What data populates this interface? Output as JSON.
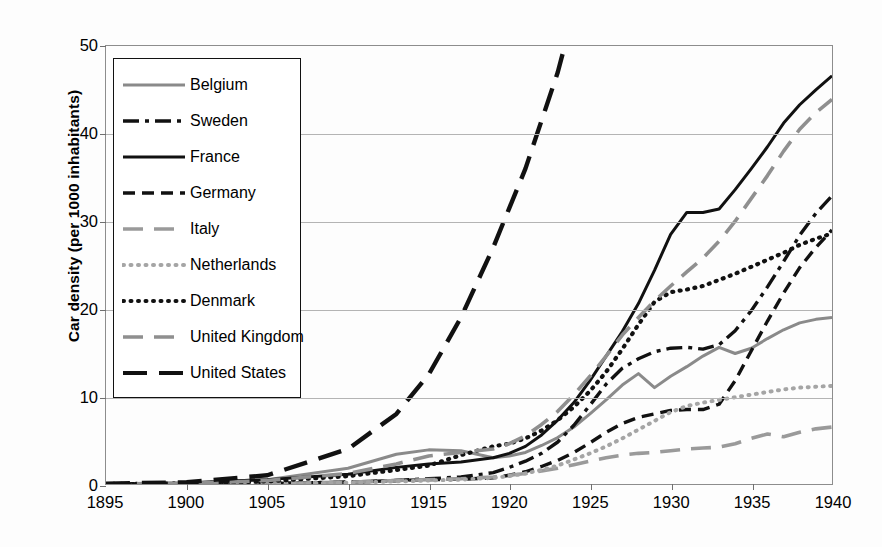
{
  "chart_data": {
    "type": "line",
    "title": "",
    "xlabel": "",
    "ylabel": "Car density (per 1000 inhabitants)",
    "xlim": [
      1895,
      1940
    ],
    "ylim": [
      0,
      50
    ],
    "grid": true,
    "legend_position": "upper-left-inside",
    "xticks": [
      1895,
      1900,
      1905,
      1910,
      1915,
      1920,
      1925,
      1930,
      1935,
      1940
    ],
    "yticks": [
      0,
      10,
      20,
      30,
      40,
      50
    ],
    "x": [
      1895,
      1900,
      1905,
      1910,
      1913,
      1915,
      1917,
      1919,
      1920,
      1921,
      1922,
      1923,
      1924,
      1925,
      1926,
      1927,
      1928,
      1929,
      1930,
      1931,
      1932,
      1933,
      1934,
      1935,
      1936,
      1937,
      1938,
      1939,
      1940
    ],
    "series": [
      {
        "name": "Belgium",
        "style": "solid",
        "color": "#8a8a8a",
        "values": [
          0.0,
          0.1,
          0.5,
          1.8,
          3.4,
          3.9,
          3.8,
          3.0,
          3.2,
          3.6,
          4.4,
          5.3,
          6.5,
          8.0,
          9.6,
          11.3,
          12.6,
          11.0,
          12.3,
          13.4,
          14.6,
          15.6,
          14.9,
          15.5,
          16.6,
          17.6,
          18.4,
          18.8,
          19.0
        ]
      },
      {
        "name": "Sweden",
        "style": "dashdot",
        "color": "#111111",
        "values": [
          0.0,
          0.0,
          0.1,
          0.2,
          0.4,
          0.6,
          0.8,
          1.3,
          1.9,
          2.6,
          3.5,
          4.8,
          6.7,
          9.0,
          11.4,
          13.2,
          14.3,
          15.1,
          15.5,
          15.6,
          15.4,
          15.9,
          17.5,
          19.8,
          22.5,
          25.4,
          28.4,
          30.9,
          32.9
        ]
      },
      {
        "name": "France",
        "style": "solid",
        "color": "#111111",
        "values": [
          0.02,
          0.1,
          0.5,
          1.1,
          1.9,
          2.3,
          2.5,
          3.0,
          3.5,
          4.3,
          5.6,
          7.3,
          9.3,
          11.8,
          14.6,
          17.4,
          20.6,
          24.4,
          28.5,
          31.0,
          31.0,
          31.4,
          33.6,
          36.0,
          38.5,
          41.2,
          43.3,
          45.0,
          46.6
        ]
      },
      {
        "name": "Germany",
        "style": "dashed",
        "color": "#111111",
        "values": [
          0.0,
          0.0,
          0.05,
          0.2,
          0.4,
          0.5,
          0.55,
          0.7,
          1.0,
          1.4,
          2.0,
          2.7,
          3.6,
          4.7,
          5.9,
          6.9,
          7.6,
          8.0,
          8.4,
          8.5,
          8.5,
          9.1,
          11.8,
          15.2,
          18.6,
          21.8,
          24.7,
          27.0,
          29.0
        ]
      },
      {
        "name": "Italy",
        "style": "longdash-gray",
        "color": "#9a9a9a",
        "values": [
          0.0,
          0.0,
          0.05,
          0.2,
          0.4,
          0.5,
          0.6,
          0.8,
          1.0,
          1.2,
          1.5,
          1.8,
          2.2,
          2.6,
          3.0,
          3.3,
          3.5,
          3.6,
          3.8,
          4.0,
          4.1,
          4.2,
          4.6,
          5.2,
          5.7,
          5.4,
          5.9,
          6.3,
          6.5
        ]
      },
      {
        "name": "Netherlands",
        "style": "dotted-gray",
        "color": "#a5a5a5",
        "values": [
          0.0,
          0.0,
          0.05,
          0.15,
          0.3,
          0.4,
          0.5,
          0.7,
          0.9,
          1.2,
          1.6,
          2.1,
          2.8,
          3.5,
          4.3,
          5.2,
          6.2,
          7.2,
          8.2,
          8.9,
          9.3,
          9.6,
          9.9,
          10.2,
          10.5,
          10.8,
          11.0,
          11.1,
          11.2
        ]
      },
      {
        "name": "Denmark",
        "style": "dotted",
        "color": "#111111",
        "values": [
          0.0,
          0.05,
          0.3,
          0.9,
          1.6,
          2.1,
          3.3,
          4.3,
          4.6,
          5.2,
          6.1,
          7.3,
          8.8,
          10.6,
          12.8,
          15.4,
          18.2,
          20.8,
          21.9,
          22.2,
          22.6,
          23.3,
          24.0,
          24.8,
          25.6,
          26.4,
          27.3,
          28.0,
          28.6
        ]
      },
      {
        "name": "United Kingdom",
        "style": "longdash-gray",
        "color": "#8f8f8f",
        "values": [
          0.0,
          0.05,
          0.4,
          1.2,
          2.3,
          3.2,
          3.6,
          4.0,
          4.6,
          5.5,
          6.8,
          8.3,
          10.2,
          12.3,
          14.6,
          17.0,
          19.0,
          20.9,
          22.6,
          24.2,
          25.8,
          27.7,
          30.0,
          32.6,
          35.2,
          38.0,
          40.5,
          42.4,
          43.9
        ]
      },
      {
        "name": "United States",
        "style": "longdash",
        "color": "#111111",
        "values": [
          0.05,
          0.2,
          1.0,
          4.0,
          8.0,
          12.5,
          19.0,
          27.0,
          31.5,
          36.0,
          41.5,
          47.0,
          52.0,
          58.0,
          63.0,
          67.0,
          70.0,
          74.0,
          76.0,
          74.0,
          71.0,
          72.0,
          76.0,
          80.0,
          84.0,
          88.0,
          90.0,
          92.0,
          94.0
        ]
      }
    ]
  },
  "legend": {
    "items": [
      {
        "label": "Belgium"
      },
      {
        "label": "Sweden"
      },
      {
        "label": "France"
      },
      {
        "label": "Germany"
      },
      {
        "label": "Italy"
      },
      {
        "label": "Netherlands"
      },
      {
        "label": "Denmark"
      },
      {
        "label": "United Kingdom"
      },
      {
        "label": "United States"
      }
    ]
  }
}
